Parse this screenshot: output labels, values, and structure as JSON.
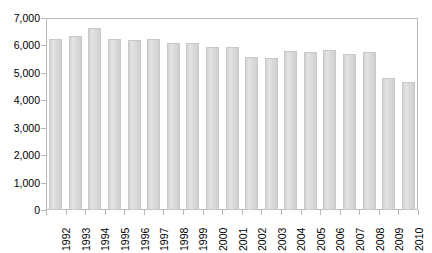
{
  "chart_data": {
    "type": "bar",
    "title": "",
    "xlabel": "",
    "ylabel": "",
    "ylim": [
      0,
      7000
    ],
    "ytick_step": 1000,
    "grid": false,
    "legend": null,
    "bar_color": "#dedede",
    "bar_border_color": "#c8c8c8",
    "axis_color": "#b9b9b9",
    "categories": [
      "1992",
      "1993",
      "1994",
      "1995",
      "1996",
      "1997",
      "1998",
      "1999",
      "2000",
      "2001",
      "2002",
      "2003",
      "2004",
      "2005",
      "2006",
      "2007",
      "2008",
      "2009",
      "2010"
    ],
    "values": [
      6250,
      6350,
      6650,
      6250,
      6200,
      6220,
      6080,
      6080,
      5940,
      5930,
      5570,
      5550,
      5800,
      5750,
      5820,
      5700,
      5760,
      4800,
      4680
    ],
    "ytick_labels": [
      "7,000",
      "6,000",
      "5,000",
      "4,000",
      "3,000",
      "2,000",
      "1,000",
      "0"
    ],
    "ytick_values": [
      7000,
      6000,
      5000,
      4000,
      3000,
      2000,
      1000,
      0
    ]
  }
}
